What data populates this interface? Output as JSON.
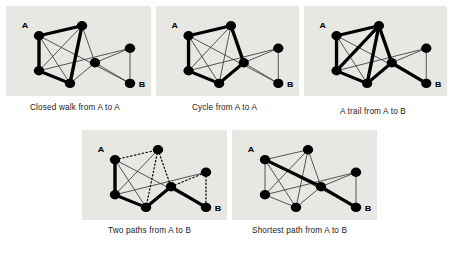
{
  "figure": {
    "background_color": "#ffffff",
    "panel_background": "#e8e7e4",
    "node_color": "#000000",
    "edge_color": "#3a3a3a",
    "highlight_color": "#000000"
  },
  "graph": {
    "nodes": [
      {
        "id": "a",
        "label": "A",
        "x": 33,
        "y": 33,
        "label_dx": -14,
        "label_dy": -9
      },
      {
        "id": "t",
        "label": "",
        "x": 76,
        "y": 22,
        "label_dx": 0,
        "label_dy": 0
      },
      {
        "id": "bl",
        "label": "",
        "x": 33,
        "y": 72,
        "label_dx": 0,
        "label_dy": 0
      },
      {
        "id": "bc",
        "label": "",
        "x": 64,
        "y": 86,
        "label_dx": 0,
        "label_dy": 0
      },
      {
        "id": "m",
        "label": "",
        "x": 89,
        "y": 63,
        "label_dx": 0,
        "label_dy": 0
      },
      {
        "id": "rt",
        "label": "",
        "x": 124,
        "y": 47,
        "label_dx": 0,
        "label_dy": 0
      },
      {
        "id": "b",
        "label": "B",
        "x": 124,
        "y": 86,
        "label_dx": 12,
        "label_dy": 4
      }
    ],
    "base_edges": [
      [
        "a",
        "t"
      ],
      [
        "a",
        "bl"
      ],
      [
        "a",
        "bc"
      ],
      [
        "t",
        "bl"
      ],
      [
        "t",
        "bc"
      ],
      [
        "t",
        "m"
      ],
      [
        "bl",
        "bc"
      ],
      [
        "bc",
        "m"
      ],
      [
        "bl",
        "rt"
      ],
      [
        "a",
        "b"
      ],
      [
        "m",
        "rt"
      ],
      [
        "m",
        "b"
      ],
      [
        "rt",
        "b"
      ]
    ]
  },
  "panels": [
    {
      "id": "closed-walk",
      "caption": "Closed walk from A to A",
      "x": 6,
      "y": 6,
      "w": 145,
      "h": 90,
      "caption_x": 30,
      "caption_y": 103,
      "bold_edges": [
        [
          "a",
          "t"
        ],
        [
          "a",
          "bl"
        ],
        [
          "bl",
          "bc"
        ],
        [
          "bc",
          "t"
        ]
      ],
      "dotted_edges": []
    },
    {
      "id": "cycle",
      "caption": "Cycle from A to A",
      "x": 156,
      "y": 6,
      "w": 143,
      "h": 90,
      "caption_x": 192,
      "caption_y": 103,
      "bold_edges": [
        [
          "a",
          "t"
        ],
        [
          "a",
          "bl"
        ],
        [
          "bl",
          "bc"
        ],
        [
          "bc",
          "m"
        ],
        [
          "m",
          "t"
        ]
      ],
      "dotted_edges": []
    },
    {
      "id": "trail",
      "caption": "A trail from A to B",
      "x": 304,
      "y": 6,
      "w": 143,
      "h": 90,
      "caption_x": 340,
      "caption_y": 107,
      "bold_edges": [
        [
          "a",
          "t"
        ],
        [
          "a",
          "bl"
        ],
        [
          "bl",
          "t"
        ],
        [
          "t",
          "bc"
        ],
        [
          "bc",
          "bl"
        ],
        [
          "t",
          "m"
        ],
        [
          "bc",
          "m"
        ],
        [
          "m",
          "b"
        ]
      ],
      "dotted_edges": []
    },
    {
      "id": "two-paths",
      "caption": "Two paths from A to B",
      "x": 82,
      "y": 130,
      "w": 145,
      "h": 90,
      "caption_x": 108,
      "caption_y": 226,
      "bold_edges": [
        [
          "a",
          "bl"
        ],
        [
          "bl",
          "bc"
        ],
        [
          "bc",
          "m"
        ],
        [
          "m",
          "b"
        ]
      ],
      "dotted_edges": [
        [
          "a",
          "t"
        ],
        [
          "t",
          "bc"
        ],
        [
          "t",
          "m"
        ],
        [
          "m",
          "rt"
        ],
        [
          "rt",
          "b"
        ]
      ]
    },
    {
      "id": "shortest-path",
      "caption": "Shortest path from A to B",
      "x": 232,
      "y": 130,
      "w": 145,
      "h": 90,
      "caption_x": 252,
      "caption_y": 226,
      "bold_edges": [
        [
          "a",
          "m"
        ],
        [
          "m",
          "b"
        ]
      ],
      "dotted_edges": []
    }
  ],
  "style": {
    "node_radius": 5.2,
    "thin_width": 0.9,
    "bold_width": 3.4,
    "dotted_width": 1.2,
    "dotted_dash": "1.6 2.4"
  }
}
